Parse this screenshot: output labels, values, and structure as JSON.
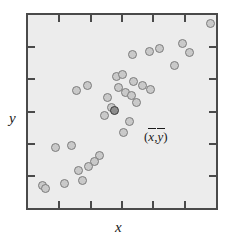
{
  "chart_data": {
    "type": "scatter",
    "title": "",
    "xlabel": "x",
    "ylabel": "y",
    "xlim": [
      0,
      100
    ],
    "ylim": [
      0,
      100
    ],
    "grid": false,
    "legend": null,
    "annotations": [
      {
        "text": "( x̄ , ȳ )",
        "meaning": "sample means centroid",
        "x": 47,
        "y": 48
      }
    ],
    "axes": {
      "x_ticks_count": 5,
      "y_ticks_count": 5,
      "tick_direction": "inward",
      "tick_labels": [],
      "frame": "box"
    },
    "series": [
      {
        "name": "observations",
        "marker": "open-circle",
        "color": "#c9c9c9",
        "edge_color": "#7c7c7c",
        "points": [
          {
            "x": 96.9,
            "y": 95.4
          },
          {
            "x": 82.3,
            "y": 85.0
          },
          {
            "x": 85.9,
            "y": 80.4
          },
          {
            "x": 69.8,
            "y": 82.8
          },
          {
            "x": 64.6,
            "y": 81.0
          },
          {
            "x": 55.7,
            "y": 79.4
          },
          {
            "x": 78.1,
            "y": 73.6
          },
          {
            "x": 46.9,
            "y": 68.0
          },
          {
            "x": 50.5,
            "y": 69.0
          },
          {
            "x": 56.3,
            "y": 65.5
          },
          {
            "x": 60.9,
            "y": 63.5
          },
          {
            "x": 48.4,
            "y": 62.5
          },
          {
            "x": 52.1,
            "y": 60.0
          },
          {
            "x": 55.2,
            "y": 58.5
          },
          {
            "x": 65.1,
            "y": 61.5
          },
          {
            "x": 57.8,
            "y": 54.5
          },
          {
            "x": 31.8,
            "y": 63.5
          },
          {
            "x": 42.2,
            "y": 57.0
          },
          {
            "x": 44.3,
            "y": 52.0
          },
          {
            "x": 40.6,
            "y": 48.0
          },
          {
            "x": 54.2,
            "y": 45.0
          },
          {
            "x": 51.0,
            "y": 39.0
          },
          {
            "x": 14.6,
            "y": 31.5
          },
          {
            "x": 23.4,
            "y": 32.5
          },
          {
            "x": 38.0,
            "y": 27.0
          },
          {
            "x": 35.4,
            "y": 24.0
          },
          {
            "x": 32.3,
            "y": 21.5
          },
          {
            "x": 26.6,
            "y": 19.5
          },
          {
            "x": 29.2,
            "y": 14.5
          },
          {
            "x": 19.3,
            "y": 12.5
          },
          {
            "x": 7.8,
            "y": 11.5
          },
          {
            "x": 9.4,
            "y": 10.0
          },
          {
            "x": 26.0,
            "y": 61.0
          }
        ]
      },
      {
        "name": "centroid",
        "marker": "filled-circle",
        "color": "#8d8d8d",
        "edge_color": "#3a3a3a",
        "points": [
          {
            "x": 45.8,
            "y": 50.5
          }
        ]
      }
    ]
  },
  "figure": {
    "x_axis_label": "x",
    "y_axis_label": "y",
    "centroid_open_paren": "(",
    "centroid_x_symbol": "x",
    "centroid_comma": ",",
    "centroid_y_symbol": "y",
    "centroid_close_paren": ")",
    "background_color": "#ececec",
    "frame_color": "#4a4a4a",
    "point_fill": "#c9c9c9",
    "point_edge": "#7c7c7c",
    "highlight_fill": "#8d8d8d",
    "highlight_edge": "#3a3a3a"
  }
}
